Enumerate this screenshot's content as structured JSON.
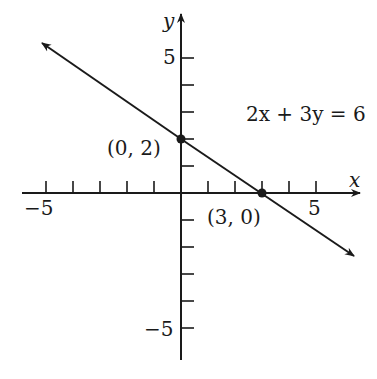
{
  "graph": {
    "equation": "2x + 3y = 6",
    "x_axis_label": "x",
    "y_axis_label": "y",
    "x_tick_labels": {
      "neg": "−5",
      "pos": "5"
    },
    "y_tick_labels": {
      "pos": "5",
      "neg": "−5"
    },
    "points": [
      {
        "label": "(0, 2)",
        "x": 0,
        "y": 2
      },
      {
        "label": "(3, 0)",
        "x": 3,
        "y": 0
      }
    ],
    "line_color": "#1a1a1a"
  }
}
